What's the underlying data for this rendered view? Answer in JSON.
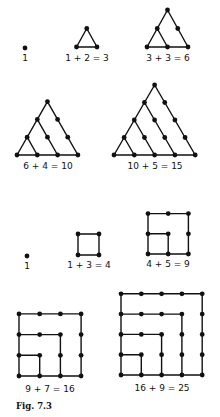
{
  "figure": {
    "caption": "Fig. 7.3",
    "triangular_numbers": {
      "description": "Triangular numbers built by adding successive rows of dots",
      "items": [
        {
          "n": 1,
          "label": "1"
        },
        {
          "n": 2,
          "label": "1 + 2 = 3"
        },
        {
          "n": 3,
          "label": "3 + 3 = 6"
        },
        {
          "n": 4,
          "label": "6 + 4 = 10"
        },
        {
          "n": 5,
          "label": "10 + 5 = 15"
        }
      ]
    },
    "square_numbers": {
      "description": "Square numbers built by adding successive L-shaped gnomons of odd numbers of dots",
      "items": [
        {
          "n": 1,
          "label": "1"
        },
        {
          "n": 2,
          "label": "1 + 3 = 4"
        },
        {
          "n": 3,
          "label": "4 + 5 = 9"
        },
        {
          "n": 4,
          "label": "9 + 7 = 16"
        },
        {
          "n": 5,
          "label": "16 + 9 = 25"
        }
      ]
    },
    "colors": {
      "ink": "#111111",
      "background": "#ffffff"
    }
  }
}
